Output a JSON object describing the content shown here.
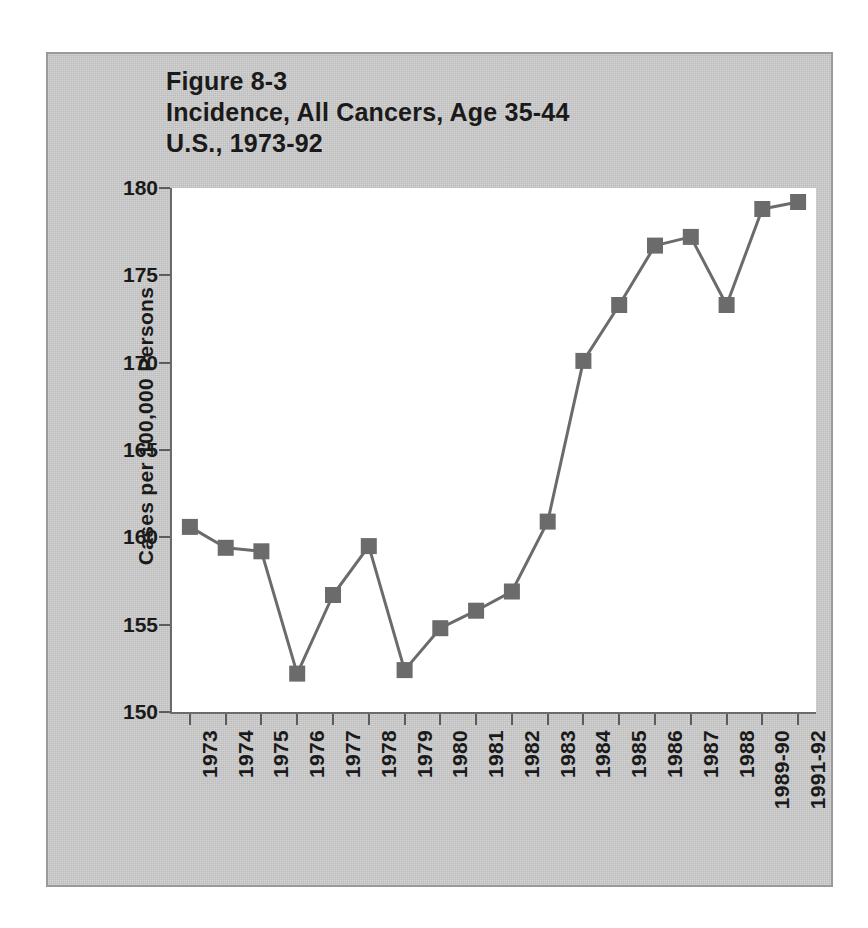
{
  "figure": {
    "title_line1": "Figure 8-3",
    "title_line2": "Incidence, All Cancers, Age 35-44",
    "title_line3": "U.S., 1973-92",
    "background_color": "#c9c9c9",
    "plot_background_color": "#ffffff",
    "series_color": "#6b6b6b",
    "axis_color": "#5c5c5c",
    "text_color": "#1a1a1a"
  },
  "chart_data": {
    "type": "line",
    "title": "Figure 8-3 Incidence, All Cancers, Age 35-44 U.S., 1973-92",
    "xlabel": "",
    "ylabel": "Cases per 100,000 Persons",
    "categories": [
      "1973",
      "1974",
      "1975",
      "1976",
      "1977",
      "1978",
      "1979",
      "1980",
      "1981",
      "1982",
      "1983",
      "1984",
      "1985",
      "1986",
      "1987",
      "1988",
      "1989-90",
      "1991-92"
    ],
    "values": [
      160.6,
      159.4,
      159.2,
      152.2,
      156.7,
      159.5,
      152.4,
      154.8,
      155.8,
      156.9,
      160.9,
      170.1,
      173.3,
      176.7,
      177.2,
      173.3,
      178.8,
      179.2
    ],
    "ylim": [
      150,
      180
    ],
    "yticks": [
      150,
      155,
      160,
      165,
      170,
      175,
      180
    ],
    "ytick_labels": [
      "150",
      "155",
      "160",
      "165",
      "170",
      "175",
      "180"
    ],
    "grid": false,
    "legend": "none",
    "marker": "square",
    "series": [
      {
        "name": "Incidence, All Cancers, Age 35-44",
        "values": [
          160.6,
          159.4,
          159.2,
          152.2,
          156.7,
          159.5,
          152.4,
          154.8,
          155.8,
          156.9,
          160.9,
          170.1,
          173.3,
          176.7,
          177.2,
          173.3,
          178.8,
          179.2
        ]
      }
    ]
  }
}
